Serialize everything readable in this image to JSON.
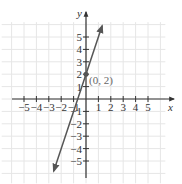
{
  "chart_data": {
    "type": "line",
    "title": "",
    "xlabel": "x",
    "ylabel": "y",
    "xlim": [
      -6,
      6
    ],
    "ylim": [
      -6,
      6
    ],
    "grid": true,
    "x_ticks": [
      -5,
      -4,
      -3,
      -2,
      -1,
      1,
      2,
      3,
      4,
      5
    ],
    "y_ticks": [
      -5,
      -4,
      -3,
      -2,
      -1,
      1,
      2,
      3,
      4,
      5
    ],
    "x_tick_labels": [
      "−5",
      "−4",
      "−3",
      "−2",
      "−1",
      "1",
      "2",
      "3",
      "4",
      "5"
    ],
    "y_tick_labels": [
      "−5",
      "−4",
      "−3",
      "−2",
      "−1",
      "1",
      "2",
      "3",
      "4",
      "5"
    ],
    "series": [
      {
        "name": "y = 3x + 2",
        "slope": 3,
        "intercept": 2,
        "x": [
          -2.6,
          1.3
        ],
        "y": [
          -5.8,
          5.9
        ],
        "arrows": "both",
        "color": "#555555"
      }
    ],
    "points": [
      {
        "x": 0,
        "y": 2,
        "label": "(0, 2)",
        "color": "#555555"
      }
    ],
    "annotations": [
      {
        "text": "(0, 2)",
        "at": [
          0,
          2
        ],
        "position": "right-below"
      }
    ]
  },
  "colors": {
    "axis": "#333333",
    "grid": "#e6e6e6",
    "line": "#555555"
  }
}
